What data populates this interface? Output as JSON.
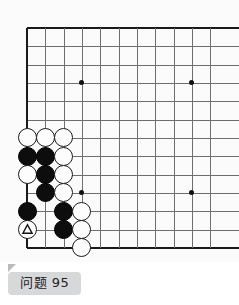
{
  "board": {
    "type": "go-board",
    "origin_x": 27,
    "origin_y": 28,
    "spacing": 18.33,
    "cols_visible": 11,
    "rows_visible": 13,
    "left_edge_is_board_edge": true,
    "bottom_edge_is_board_edge": true,
    "top_edge_is_board_edge": true,
    "line_color": "#6e6e6e",
    "edge_color": "#1a1a1a",
    "background_color": "#fbfbfb",
    "star_points": [
      {
        "col": 3,
        "row": 3
      },
      {
        "col": 9,
        "row": 3
      },
      {
        "col": 3,
        "row": 9
      },
      {
        "col": 9,
        "row": 9
      }
    ],
    "stones": [
      {
        "col": 0,
        "row": 6,
        "color": "white",
        "mark": null
      },
      {
        "col": 1,
        "row": 6,
        "color": "white",
        "mark": null
      },
      {
        "col": 2,
        "row": 6,
        "color": "white",
        "mark": null
      },
      {
        "col": 0,
        "row": 7,
        "color": "black",
        "mark": null
      },
      {
        "col": 1,
        "row": 7,
        "color": "black",
        "mark": null
      },
      {
        "col": 2,
        "row": 7,
        "color": "white",
        "mark": null
      },
      {
        "col": 0,
        "row": 8,
        "color": "white",
        "mark": null
      },
      {
        "col": 1,
        "row": 8,
        "color": "black",
        "mark": null
      },
      {
        "col": 2,
        "row": 8,
        "color": "white",
        "mark": null
      },
      {
        "col": 1,
        "row": 9,
        "color": "black",
        "mark": null
      },
      {
        "col": 2,
        "row": 9,
        "color": "white",
        "mark": null
      },
      {
        "col": 0,
        "row": 10,
        "color": "black",
        "mark": null
      },
      {
        "col": 2,
        "row": 10,
        "color": "black",
        "mark": null
      },
      {
        "col": 3,
        "row": 10,
        "color": "white",
        "mark": null
      },
      {
        "col": 0,
        "row": 11,
        "color": "white",
        "mark": "triangle"
      },
      {
        "col": 2,
        "row": 11,
        "color": "black",
        "mark": null
      },
      {
        "col": 3,
        "row": 11,
        "color": "white",
        "mark": null
      },
      {
        "col": 3,
        "row": 12,
        "color": "white",
        "mark": null
      }
    ]
  },
  "label": {
    "text": "问题 95",
    "background_color": "#d7d8da",
    "text_color": "#232323"
  }
}
